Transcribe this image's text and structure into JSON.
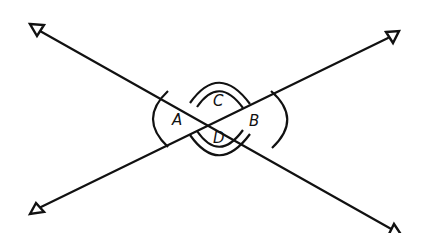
{
  "diagram": {
    "type": "intersecting-lines-vertical-angles",
    "intersection_point": [
      219,
      119
    ],
    "lines": [
      {
        "name": "line-1",
        "direction": "upper-left to lower-right",
        "from": [
          37,
          30
        ],
        "to": [
          397,
          233
        ]
      },
      {
        "name": "line-2",
        "direction": "lower-left to upper-right",
        "from": [
          38,
          209
        ],
        "to": [
          392,
          36
        ]
      }
    ],
    "angles": [
      {
        "label": "A",
        "position": "left",
        "arc_count": 1
      },
      {
        "label": "B",
        "position": "right",
        "arc_count": 1
      },
      {
        "label": "C",
        "position": "top",
        "arc_count": 2
      },
      {
        "label": "D",
        "position": "bottom",
        "arc_count": 2
      }
    ],
    "labels": {
      "A": "A",
      "B": "B",
      "C": "C",
      "D": "D"
    },
    "colors": {
      "stroke": "#111111",
      "background": "#ffffff"
    }
  }
}
